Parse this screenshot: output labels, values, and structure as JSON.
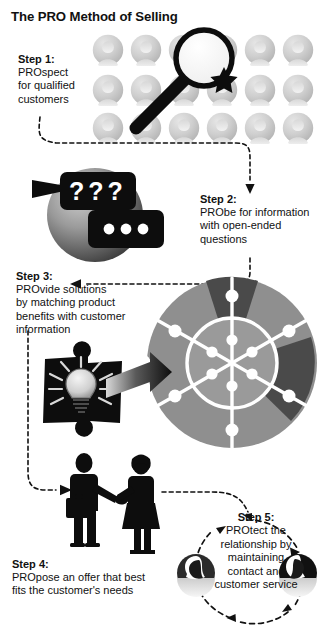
{
  "title": "The PRO Method of Selling",
  "steps": [
    {
      "id": "step1",
      "heading": "Step 1:",
      "body": "PROspect\nfor qualified\ncustomers",
      "icon": "magnifying-glass-over-crowd"
    },
    {
      "id": "step2",
      "heading": "Step 2:",
      "body": "PRObe for information\nwith open-ended\nquestions",
      "icon": "speech-bubbles-question-answer"
    },
    {
      "id": "step3",
      "heading": "Step 3:",
      "body": "PROvide solutions\nby matching product\nbenefits with customer\ninformation",
      "icon": "jigsaw-circle-with-lightbulb-piece"
    },
    {
      "id": "step4",
      "heading": "Step 4:",
      "body": "PROpose an offer that best\nfits the customer's needs",
      "icon": "handshake-silhouettes"
    },
    {
      "id": "step5",
      "heading": "Step 5:",
      "body": "PROtect the\nrelationship by\nmaintaining\ncontact and\ncustomer service",
      "icon": "two-people-cycle"
    }
  ],
  "graphics": {
    "bubble_question_text": "???",
    "bubble_answer_text": "•••"
  },
  "colors": {
    "background": "#ffffff",
    "text": "#111111",
    "ink_black": "#0d0d0d",
    "puzzle_mid_gray": "#8f8f8f",
    "puzzle_dark_gray": "#4a4a4a",
    "puzzle_light_gray": "#a8a8a8",
    "avatar_gray": "#c9c9c9",
    "avatar_gray_dark": "#b0b0b0",
    "sphere_gray": "#8a8a8a"
  }
}
